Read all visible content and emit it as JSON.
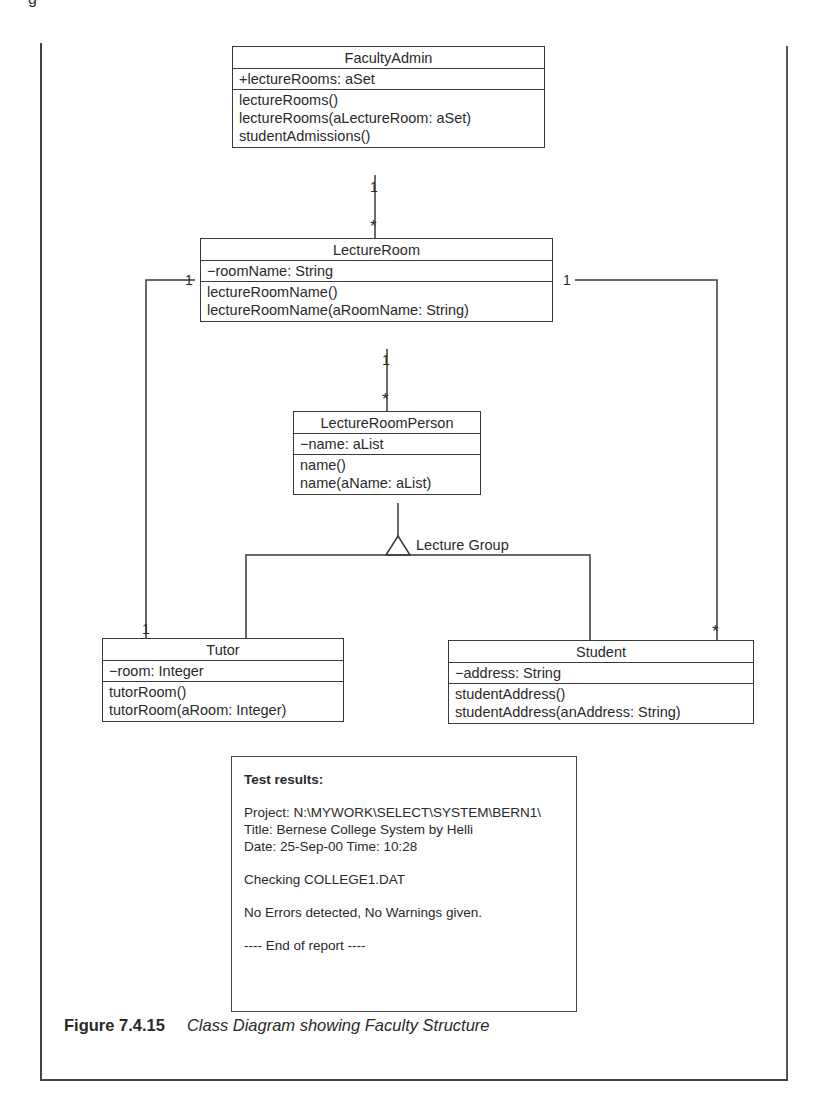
{
  "figure": {
    "number": "Figure 7.4.15",
    "caption": "Class Diagram showing Faculty Structure"
  },
  "classes": {
    "faculty_admin": {
      "name": "FacultyAdmin",
      "attributes": [
        "+lectureRooms: aSet"
      ],
      "operations": [
        "lectureRooms()",
        "lectureRooms(aLectureRoom: aSet)",
        "studentAdmissions()"
      ]
    },
    "lecture_room": {
      "name": "LectureRoom",
      "attributes": [
        "−roomName: String"
      ],
      "operations": [
        "lectureRoomName()",
        "lectureRoomName(aRoomName: String)"
      ]
    },
    "lecture_room_person": {
      "name": "LectureRoomPerson",
      "attributes": [
        "−name: aList"
      ],
      "operations": [
        "name()",
        "name(aName: aList)"
      ]
    },
    "tutor": {
      "name": "Tutor",
      "attributes": [
        "−room: Integer"
      ],
      "operations": [
        "tutorRoom()",
        "tutorRoom(aRoom: Integer)"
      ]
    },
    "student": {
      "name": "Student",
      "attributes": [
        "−address: String"
      ],
      "operations": [
        "studentAddress()",
        "studentAddress(anAddress: String)"
      ]
    }
  },
  "relationships": {
    "admin_room": {
      "from_mult": "1",
      "to_mult": "*"
    },
    "room_person": {
      "from_mult": "1",
      "to_mult": "*"
    },
    "room_tutor": {
      "from_mult": "1",
      "to_mult": "1"
    },
    "room_student": {
      "from_mult": "1",
      "to_mult": "*"
    },
    "generalization_label": "Lecture Group"
  },
  "report": {
    "heading": "Test results:",
    "project": "Project: N:\\MYWORK\\SELECT\\SYSTEM\\BERN1\\",
    "title": "Title: Bernese College System by Helli",
    "date": "Date: 25-Sep-00 Time: 10:28",
    "checking": "Checking COLLEGE1.DAT",
    "result": "No Errors detected, No Warnings given.",
    "end": "---- End of report ----"
  }
}
